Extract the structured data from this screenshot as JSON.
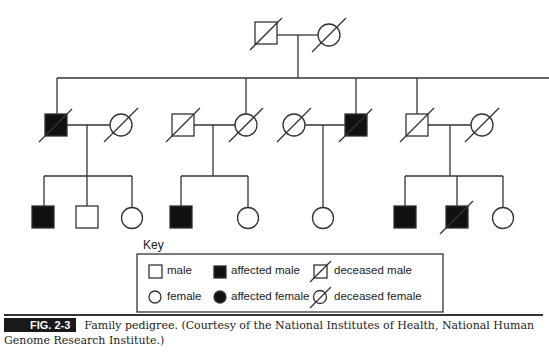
{
  "figure": {
    "label": "FIG. 2-3",
    "caption": "Family pedigree. (Courtesy of the National Institutes of Health, National Human Genome Research Institute.)"
  },
  "key": {
    "title": "Key",
    "items": [
      {
        "symbol": "square",
        "label": "male"
      },
      {
        "symbol": "filled-square",
        "label": "affected male"
      },
      {
        "symbol": "slashed-square",
        "label": "deceased male"
      },
      {
        "symbol": "circle",
        "label": "female"
      },
      {
        "symbol": "filled-circle",
        "label": "affected female"
      },
      {
        "symbol": "slashed-circle",
        "label": "deceased female"
      }
    ]
  },
  "pedigree": {
    "generation_1": [
      {
        "sex": "male",
        "affected": false,
        "deceased": true
      },
      {
        "sex": "female",
        "affected": false,
        "deceased": true
      }
    ],
    "generation_2_couples": [
      {
        "a": {
          "sex": "male",
          "affected": true,
          "deceased": true
        },
        "b": {
          "sex": "female",
          "affected": false,
          "deceased": true
        }
      },
      {
        "a": {
          "sex": "male",
          "affected": false,
          "deceased": true
        },
        "b": {
          "sex": "female",
          "affected": false,
          "deceased": true
        }
      },
      {
        "a": {
          "sex": "female",
          "affected": false,
          "deceased": true
        },
        "b": {
          "sex": "male",
          "affected": true,
          "deceased": true
        }
      },
      {
        "a": {
          "sex": "male",
          "affected": false,
          "deceased": true
        },
        "b": {
          "sex": "female",
          "affected": false,
          "deceased": true
        }
      }
    ],
    "generation_3_families": [
      [
        {
          "sex": "male",
          "affected": true,
          "deceased": false
        },
        {
          "sex": "male",
          "affected": false,
          "deceased": false
        },
        {
          "sex": "female",
          "affected": false,
          "deceased": false
        }
      ],
      [
        {
          "sex": "male",
          "affected": true,
          "deceased": false
        },
        {
          "sex": "female",
          "affected": false,
          "deceased": false
        }
      ],
      [
        {
          "sex": "female",
          "affected": false,
          "deceased": false
        }
      ],
      [
        {
          "sex": "male",
          "affected": true,
          "deceased": false
        },
        {
          "sex": "male",
          "affected": true,
          "deceased": true
        },
        {
          "sex": "female",
          "affected": false,
          "deceased": false
        }
      ]
    ]
  }
}
